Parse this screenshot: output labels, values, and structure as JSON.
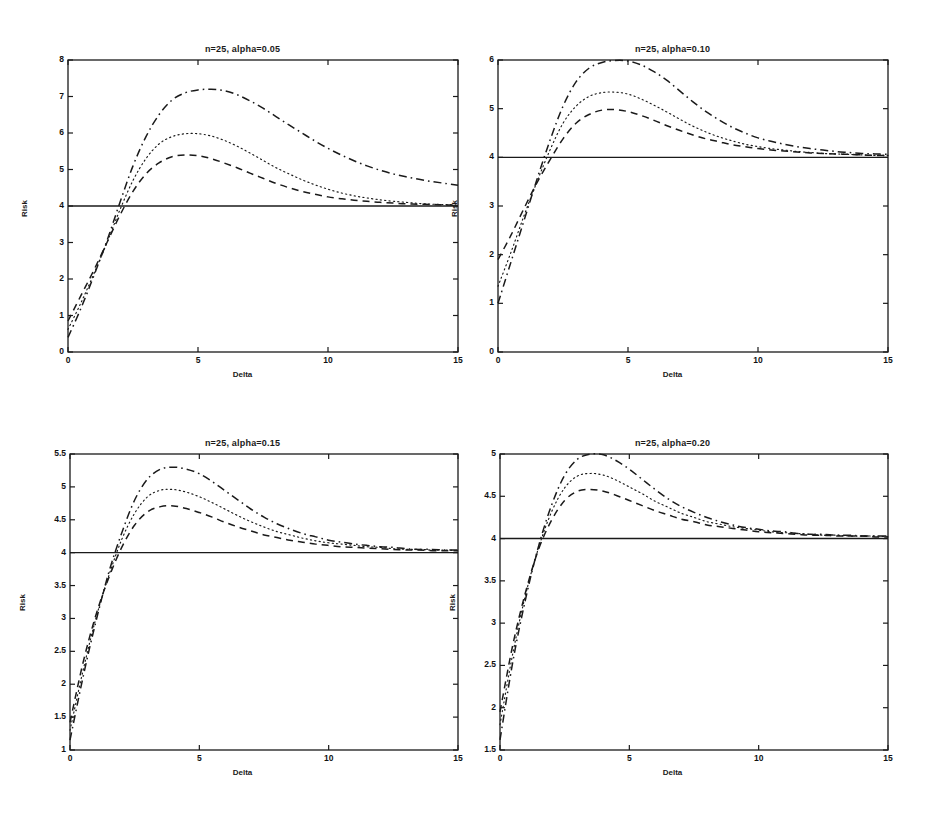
{
  "figure": {
    "width": 930,
    "height": 827,
    "background": "#ffffff",
    "ink": "#1a1a1a"
  },
  "common": {
    "xlabel": "Delta",
    "ylabel": "Risk",
    "xticks": [
      "0",
      "5",
      "10",
      "15"
    ],
    "xtick_values": [
      0,
      5,
      10,
      15
    ],
    "xlim": [
      0,
      15
    ],
    "reference_line_value": 4,
    "series_names": [
      "upper-dashdot",
      "middle-dotted",
      "lower-dashed",
      "reference-solid"
    ],
    "series_styles": [
      "dashdot",
      "dotted",
      "dashed",
      "solid"
    ]
  },
  "chart_data": [
    {
      "id": "panel-a",
      "type": "line",
      "title": "n=25, alpha=0.05",
      "xlabel": "Delta",
      "ylabel": "Risk",
      "xlim": [
        0,
        15
      ],
      "ylim": [
        0,
        8
      ],
      "xticks": [
        0,
        5,
        10,
        15
      ],
      "yticks": [
        0,
        1,
        2,
        3,
        4,
        5,
        6,
        7,
        8
      ],
      "ytick_labels": [
        "0",
        "1",
        "2",
        "3",
        "4",
        "5",
        "6",
        "7",
        "8"
      ],
      "grid": false,
      "legend": "none",
      "x": [
        0,
        0.5,
        1,
        1.5,
        2,
        2.5,
        3,
        3.5,
        4,
        4.5,
        5,
        5.5,
        6,
        6.5,
        7,
        7.5,
        8,
        8.5,
        9,
        9.5,
        10,
        10.5,
        11,
        11.5,
        12,
        12.5,
        13,
        13.5,
        14,
        14.5,
        15
      ],
      "series": [
        {
          "name": "upper-dashdot",
          "style": "dashdot",
          "values": [
            0.4,
            1.2,
            2.1,
            3.05,
            4.1,
            5.1,
            5.9,
            6.5,
            6.9,
            7.1,
            7.18,
            7.2,
            7.16,
            7.05,
            6.88,
            6.68,
            6.45,
            6.22,
            6.0,
            5.78,
            5.58,
            5.4,
            5.24,
            5.1,
            4.98,
            4.88,
            4.8,
            4.73,
            4.67,
            4.62,
            4.57
          ]
        },
        {
          "name": "middle-dotted",
          "style": "dotted",
          "values": [
            0.62,
            1.35,
            2.15,
            3.0,
            3.9,
            4.7,
            5.3,
            5.7,
            5.9,
            5.98,
            5.98,
            5.92,
            5.8,
            5.64,
            5.45,
            5.25,
            5.05,
            4.88,
            4.72,
            4.58,
            4.46,
            4.36,
            4.28,
            4.22,
            4.17,
            4.13,
            4.1,
            4.07,
            4.05,
            4.04,
            4.03
          ]
        },
        {
          "name": "lower-dashed",
          "style": "dashed",
          "values": [
            0.85,
            1.55,
            2.25,
            3.0,
            3.75,
            4.4,
            4.88,
            5.18,
            5.35,
            5.4,
            5.38,
            5.3,
            5.18,
            5.05,
            4.9,
            4.76,
            4.62,
            4.5,
            4.4,
            4.32,
            4.25,
            4.2,
            4.16,
            4.13,
            4.1,
            4.08,
            4.06,
            4.05,
            4.04,
            4.03,
            4.02
          ]
        },
        {
          "name": "reference-solid",
          "style": "solid",
          "values": [
            4,
            4,
            4,
            4,
            4,
            4,
            4,
            4,
            4,
            4,
            4,
            4,
            4,
            4,
            4,
            4,
            4,
            4,
            4,
            4,
            4,
            4,
            4,
            4,
            4,
            4,
            4,
            4,
            4,
            4,
            4
          ]
        }
      ]
    },
    {
      "id": "panel-b",
      "type": "line",
      "title": "n=25, alpha=0.10",
      "xlabel": "Delta",
      "ylabel": "Risk",
      "xlim": [
        0,
        15
      ],
      "ylim": [
        0,
        6
      ],
      "xticks": [
        0,
        5,
        10,
        15
      ],
      "yticks": [
        0,
        1,
        2,
        3,
        4,
        5,
        6
      ],
      "ytick_labels": [
        "0",
        "1",
        "2",
        "3",
        "4",
        "5",
        "6"
      ],
      "grid": false,
      "legend": "none",
      "x": [
        0,
        0.5,
        1,
        1.5,
        2,
        2.5,
        3,
        3.5,
        4,
        4.5,
        5,
        5.5,
        6,
        6.5,
        7,
        7.5,
        8,
        8.5,
        9,
        9.5,
        10,
        10.5,
        11,
        11.5,
        12,
        12.5,
        13,
        13.5,
        14,
        14.5,
        15
      ],
      "series": [
        {
          "name": "upper-dashdot",
          "style": "dashdot",
          "values": [
            1.0,
            1.85,
            2.7,
            3.55,
            4.35,
            5.05,
            5.55,
            5.83,
            5.95,
            5.99,
            5.98,
            5.9,
            5.76,
            5.58,
            5.36,
            5.14,
            4.94,
            4.77,
            4.62,
            4.5,
            4.4,
            4.33,
            4.27,
            4.22,
            4.18,
            4.15,
            4.12,
            4.1,
            4.08,
            4.07,
            4.06
          ]
        },
        {
          "name": "middle-dotted",
          "style": "dotted",
          "values": [
            1.35,
            2.05,
            2.8,
            3.5,
            4.15,
            4.7,
            5.05,
            5.25,
            5.33,
            5.34,
            5.3,
            5.2,
            5.07,
            4.93,
            4.78,
            4.64,
            4.52,
            4.42,
            4.34,
            4.27,
            4.22,
            4.18,
            4.15,
            4.12,
            4.1,
            4.08,
            4.07,
            4.06,
            4.05,
            4.04,
            4.04
          ]
        },
        {
          "name": "lower-dashed",
          "style": "dashed",
          "values": [
            1.9,
            2.4,
            2.95,
            3.48,
            3.95,
            4.38,
            4.7,
            4.88,
            4.97,
            4.98,
            4.94,
            4.86,
            4.76,
            4.65,
            4.55,
            4.46,
            4.38,
            4.32,
            4.26,
            4.22,
            4.18,
            4.15,
            4.13,
            4.11,
            4.09,
            4.08,
            4.07,
            4.06,
            4.05,
            4.04,
            4.04
          ]
        },
        {
          "name": "reference-solid",
          "style": "solid",
          "values": [
            4,
            4,
            4,
            4,
            4,
            4,
            4,
            4,
            4,
            4,
            4,
            4,
            4,
            4,
            4,
            4,
            4,
            4,
            4,
            4,
            4,
            4,
            4,
            4,
            4,
            4,
            4,
            4,
            4,
            4,
            4
          ]
        }
      ]
    },
    {
      "id": "panel-c",
      "type": "line",
      "title": "n=25, alpha=0.15",
      "xlabel": "Delta",
      "ylabel": "Risk",
      "xlim": [
        0,
        15
      ],
      "ylim": [
        1,
        5.5
      ],
      "xticks": [
        0,
        5,
        10,
        15
      ],
      "yticks": [
        1,
        1.5,
        2,
        2.5,
        3,
        3.5,
        4,
        4.5,
        5,
        5.5
      ],
      "ytick_labels": [
        "1",
        "1.5",
        "2",
        "2.5",
        "3",
        "3.5",
        "4",
        "4.5",
        "5",
        "5.5"
      ],
      "grid": false,
      "legend": "none",
      "x": [
        0,
        0.5,
        1,
        1.5,
        2,
        2.5,
        3,
        3.5,
        4,
        4.5,
        5,
        5.5,
        6,
        6.5,
        7,
        7.5,
        8,
        8.5,
        9,
        9.5,
        10,
        10.5,
        11,
        11.5,
        12,
        12.5,
        13,
        13.5,
        14,
        14.5,
        15
      ],
      "series": [
        {
          "name": "upper-dashdot",
          "style": "dashdot",
          "values": [
            1.15,
            2.1,
            2.95,
            3.7,
            4.3,
            4.8,
            5.12,
            5.27,
            5.3,
            5.27,
            5.2,
            5.08,
            4.94,
            4.8,
            4.66,
            4.54,
            4.44,
            4.36,
            4.29,
            4.24,
            4.19,
            4.16,
            4.13,
            4.11,
            4.09,
            4.08,
            4.06,
            4.05,
            4.05,
            4.04,
            4.04
          ]
        },
        {
          "name": "middle-dotted",
          "style": "dotted",
          "values": [
            1.3,
            2.2,
            3.0,
            3.65,
            4.2,
            4.6,
            4.85,
            4.95,
            4.96,
            4.92,
            4.85,
            4.76,
            4.66,
            4.56,
            4.47,
            4.39,
            4.32,
            4.27,
            4.22,
            4.18,
            4.15,
            4.13,
            4.11,
            4.09,
            4.08,
            4.06,
            4.05,
            4.05,
            4.04,
            4.04,
            4.03
          ]
        },
        {
          "name": "lower-dashed",
          "style": "dashed",
          "values": [
            1.42,
            2.32,
            3.05,
            3.62,
            4.08,
            4.42,
            4.62,
            4.7,
            4.71,
            4.67,
            4.61,
            4.54,
            4.46,
            4.39,
            4.33,
            4.27,
            4.23,
            4.19,
            4.16,
            4.13,
            4.11,
            4.09,
            4.08,
            4.07,
            4.06,
            4.05,
            4.04,
            4.04,
            4.03,
            4.03,
            4.03
          ]
        },
        {
          "name": "reference-solid",
          "style": "solid",
          "values": [
            4,
            4,
            4,
            4,
            4,
            4,
            4,
            4,
            4,
            4,
            4,
            4,
            4,
            4,
            4,
            4,
            4,
            4,
            4,
            4,
            4,
            4,
            4,
            4,
            4,
            4,
            4,
            4,
            4,
            4,
            4
          ]
        }
      ]
    },
    {
      "id": "panel-d",
      "type": "line",
      "title": "n=25, alpha=0.20",
      "xlabel": "Delta",
      "ylabel": "Risk",
      "xlim": [
        0,
        15
      ],
      "ylim": [
        1.5,
        5
      ],
      "xticks": [
        0,
        5,
        10,
        15
      ],
      "yticks": [
        1.5,
        2,
        2.5,
        3,
        3.5,
        4,
        4.5,
        5
      ],
      "ytick_labels": [
        "1.5",
        "2",
        "2.5",
        "3",
        "3.5",
        "4",
        "4.5",
        "5"
      ],
      "grid": false,
      "legend": "none",
      "x": [
        0,
        0.5,
        1,
        1.5,
        2,
        2.5,
        3,
        3.5,
        4,
        4.5,
        5,
        5.5,
        6,
        6.5,
        7,
        7.5,
        8,
        8.5,
        9,
        9.5,
        10,
        10.5,
        11,
        11.5,
        12,
        12.5,
        13,
        13.5,
        14,
        14.5,
        15
      ],
      "series": [
        {
          "name": "upper-dashdot",
          "style": "dashdot",
          "values": [
            1.62,
            2.55,
            3.3,
            3.92,
            4.4,
            4.75,
            4.94,
            5.0,
            4.99,
            4.92,
            4.82,
            4.7,
            4.58,
            4.47,
            4.38,
            4.31,
            4.25,
            4.2,
            4.16,
            4.13,
            4.11,
            4.09,
            4.08,
            4.06,
            4.05,
            4.05,
            4.04,
            4.04,
            4.03,
            4.03,
            4.03
          ]
        },
        {
          "name": "middle-dotted",
          "style": "dotted",
          "values": [
            1.8,
            2.65,
            3.35,
            3.9,
            4.32,
            4.6,
            4.74,
            4.77,
            4.75,
            4.69,
            4.61,
            4.53,
            4.44,
            4.37,
            4.3,
            4.25,
            4.2,
            4.17,
            4.14,
            4.12,
            4.1,
            4.08,
            4.07,
            4.06,
            4.05,
            4.04,
            4.04,
            4.03,
            4.03,
            4.03,
            4.02
          ]
        },
        {
          "name": "lower-dashed",
          "style": "dashed",
          "values": [
            1.95,
            2.75,
            3.38,
            3.88,
            4.22,
            4.45,
            4.56,
            4.58,
            4.56,
            4.51,
            4.45,
            4.39,
            4.33,
            4.28,
            4.23,
            4.2,
            4.16,
            4.14,
            4.12,
            4.1,
            4.08,
            4.07,
            4.06,
            4.05,
            4.04,
            4.04,
            4.03,
            4.03,
            4.03,
            4.02,
            4.02
          ]
        },
        {
          "name": "reference-solid",
          "style": "solid",
          "values": [
            4,
            4,
            4,
            4,
            4,
            4,
            4,
            4,
            4,
            4,
            4,
            4,
            4,
            4,
            4,
            4,
            4,
            4,
            4,
            4,
            4,
            4,
            4,
            4,
            4,
            4,
            4,
            4,
            4,
            4,
            4
          ]
        }
      ]
    }
  ]
}
